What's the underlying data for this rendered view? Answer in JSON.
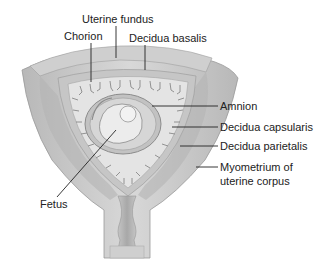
{
  "diagram": {
    "colors": {
      "outer_tissue": "#c8c8c8",
      "myometrium": "#d4d4d4",
      "decidua": "#bdbdbd",
      "chorion_cavity": "#e6e6e6",
      "amnion": "#a9a9a9",
      "fetus": "#dcdcdc",
      "leader_line": "#222222"
    },
    "labels": {
      "uterine_fundus": "Uterine fundus",
      "chorion": "Chorion",
      "decidua_basalis": "Decidua basalis",
      "amnion": "Amnion",
      "decidua_capsularis": "Decidua capsularis",
      "decidua_parietalis": "Decidua parietalis",
      "myometrium_line1": "Myometrium of",
      "myometrium_line2": "uterine corpus",
      "fetus": "Fetus"
    }
  }
}
